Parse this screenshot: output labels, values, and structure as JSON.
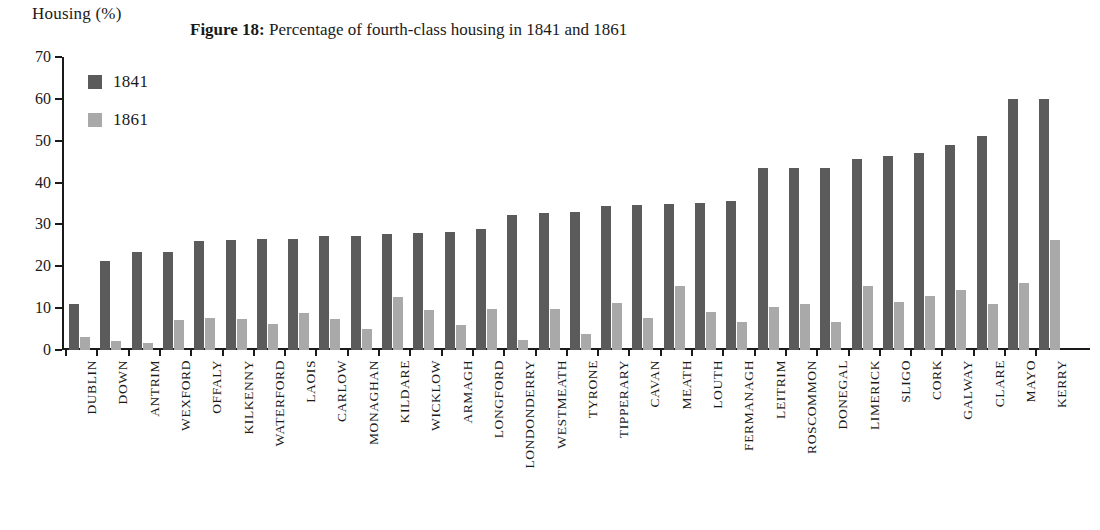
{
  "axis_title": "Housing (%)",
  "caption": {
    "label": "Figure 18:",
    "text": "Percentage of fourth-class housing in 1841 and 1861"
  },
  "legend": {
    "position": "top-left-inside",
    "entries": [
      {
        "name": "1841",
        "color": "#5b5b5b"
      },
      {
        "name": "1861",
        "color": "#a9a9a9"
      }
    ]
  },
  "colors": {
    "series_1841": "#5b5b5b",
    "series_1861": "#a9a9a9",
    "axis": "#1a1a1a",
    "background": "#ffffff"
  },
  "chart_data": {
    "type": "bar",
    "title": "Figure 18: Percentage of fourth-class housing in 1841 and 1861",
    "xlabel": "",
    "ylabel": "Housing (%)",
    "ylim": [
      0,
      70
    ],
    "yticks": [
      0,
      10,
      20,
      30,
      40,
      50,
      60,
      70
    ],
    "grid": false,
    "legend": [
      "1841",
      "1861"
    ],
    "categories": [
      "DUBLIN",
      "DOWN",
      "ANTRIM",
      "WEXFORD",
      "OFFALY",
      "KILKENNY",
      "WATERFORD",
      "LAOIS",
      "CARLOW",
      "MONAGHAN",
      "KILDARE",
      "WICKLOW",
      "ARMAGH",
      "LONGFORD",
      "LONDONDERRY",
      "WESTMEATH",
      "TYRONE",
      "TIPPERARY",
      "CAVAN",
      "MEATH",
      "LOUTH",
      "FERMANAGH",
      "LEITRIM",
      "ROSCOMMON",
      "DONEGAL",
      "LIMERICK",
      "SLIGO",
      "CORK",
      "GALWAY",
      "CLARE",
      "MAYO",
      "KERRY"
    ],
    "series": [
      {
        "name": "1841",
        "color": "#5b5b5b",
        "values": [
          10.9,
          21.3,
          23.4,
          23.5,
          26.1,
          26.4,
          26.5,
          26.6,
          27.2,
          27.3,
          27.6,
          28.0,
          28.3,
          29.0,
          32.3,
          32.7,
          33.0,
          34.4,
          34.6,
          34.9,
          35.2,
          35.5,
          43.4,
          43.5,
          43.6,
          45.7,
          46.4,
          47.0,
          48.9,
          51.2,
          59.9,
          60.0
        ]
      },
      {
        "name": "1861",
        "color": "#a9a9a9",
        "values": [
          3.0,
          2.2,
          1.7,
          7.1,
          7.7,
          7.5,
          6.3,
          8.8,
          7.3,
          5.0,
          12.7,
          9.5,
          6.0,
          9.8,
          2.4,
          9.7,
          3.8,
          11.2,
          7.7,
          15.4,
          9.2,
          6.6,
          10.2,
          11.0,
          6.8,
          15.2,
          11.4,
          13.0,
          14.4,
          10.9,
          16.0,
          26.4
        ]
      }
    ]
  }
}
